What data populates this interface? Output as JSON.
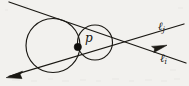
{
  "figure": {
    "background_color": "#f2f1ee",
    "ink_color": "#15140f",
    "width": 189,
    "height": 86,
    "labels": {
      "point_p": "p",
      "line_j_base": "ℓ",
      "line_j_subscript": "j",
      "line_i_base": "ℓ",
      "line_i_subscript": "i"
    },
    "elements": {
      "large_circle": {
        "name": "large-circle",
        "cx": 53,
        "cy": 45.5,
        "r": 27
      },
      "small_circle": {
        "name": "small-circle",
        "cx": 95,
        "cy": 42.5,
        "r": 17.5
      },
      "tangency_point": {
        "name": "point-p-dot",
        "cx": 77.8,
        "cy": 47.0,
        "r": 3.6
      },
      "line_j": {
        "name": "line-ell-j",
        "x1": 9,
        "y1": 2,
        "x2": 186,
        "y2": 63
      },
      "line_i": {
        "name": "line-ell-i",
        "x1": 7,
        "y1": 77,
        "x2": 184,
        "y2": 24
      },
      "intersection": {
        "x": 146,
        "y": 41
      },
      "arrow_left": {
        "name": "arrowhead-lower-left",
        "tip_x": 7,
        "tip_y": 77
      },
      "arrow_right": {
        "name": "arrowhead-right",
        "tip_x": 166,
        "tip_y": 48
      }
    }
  }
}
